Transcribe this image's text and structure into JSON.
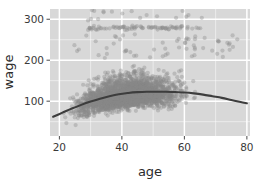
{
  "chart_data": {
    "type": "scatter",
    "title": "",
    "subtitle": "",
    "xlabel": "age",
    "ylabel": "wage",
    "xlim": [
      17,
      81
    ],
    "ylim": [
      15,
      325
    ],
    "xticks": [
      20,
      40,
      60,
      80
    ],
    "yticks": [
      100,
      200,
      300
    ],
    "xtick_labels": [
      "20",
      "40",
      "60",
      "80"
    ],
    "ytick_labels": [
      "100",
      "200",
      "300"
    ],
    "grid": true,
    "grid_major": true,
    "grid_minor": true,
    "legend": "none",
    "panel_background": "#d8d8d8",
    "grid_color": "#ffffff",
    "point_color": "#8a8a8a",
    "point_opacity": 0.38,
    "point_radius": 2.1,
    "point_count": 3000,
    "series": [
      {
        "name": "wage observations",
        "type": "scatter",
        "note": "dense mass of low-to-mid wages plus a capped high-wage band near 280",
        "clusters": [
          {
            "name": "main-mass",
            "n": 2540,
            "x_range": [
              18,
              80
            ],
            "x_mode": 42,
            "y_center": 98,
            "y_spread": 38,
            "y_min": 20,
            "y_max": 210
          },
          {
            "name": "capped-high-band",
            "n": 80,
            "x_range": [
              28,
              67
            ],
            "y_center": 279,
            "y_spread": 4
          },
          {
            "name": "upper-outliers",
            "n": 18,
            "x_range": [
              25,
              66
            ],
            "y_range": [
              295,
              322
            ]
          },
          {
            "name": "mid-outliers",
            "n": 60,
            "x_range": [
              22,
              78
            ],
            "y_range": [
              205,
              265
            ]
          }
        ]
      },
      {
        "name": "smooth fit",
        "type": "line",
        "color": "#3d3d3d",
        "width": 2.1,
        "x": [
          18,
          21,
          24,
          27,
          30,
          33,
          36,
          39,
          42,
          45,
          48,
          51,
          54,
          57,
          60,
          63,
          66,
          69,
          72,
          75,
          78,
          80
        ],
        "y": [
          62,
          72,
          82,
          91,
          99,
          106,
          112,
          117,
          120,
          122,
          123,
          123,
          123,
          122,
          121,
          119,
          116,
          112,
          108,
          103,
          98,
          95
        ]
      }
    ]
  },
  "axes": {
    "x_title": "age",
    "y_title": "wage"
  }
}
